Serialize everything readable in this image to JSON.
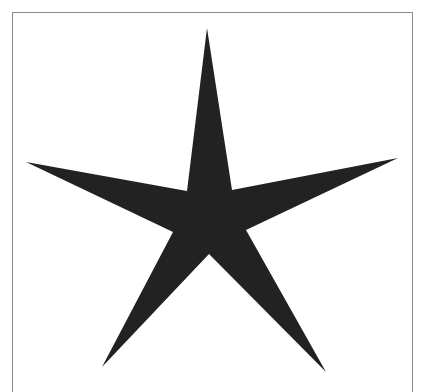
{
  "figure": {
    "frame_color": "#8a8a8a",
    "background_color": "#ffffff"
  },
  "star": {
    "icon": "star-icon",
    "fill_color": "#222222",
    "points": "207,28 232,190 398,158 246,230 326,372 209,254 102,367 173,232 26,162 187,191"
  }
}
